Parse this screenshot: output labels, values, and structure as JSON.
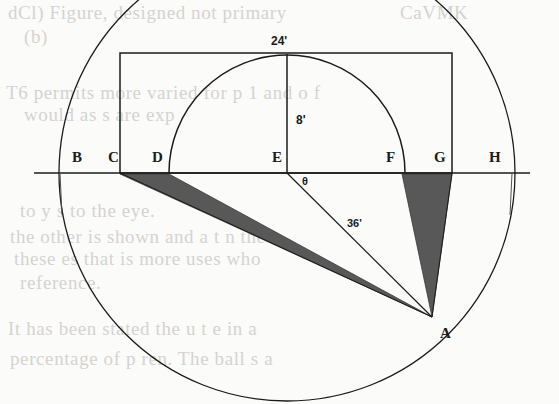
{
  "figure": {
    "background_color": "#fbfbfa",
    "stroke_color": "#1b1b1b",
    "shade_color": "#585858",
    "baseline": {
      "y": 173,
      "x_start": 34,
      "x_end": 530
    },
    "point_labels": [
      {
        "id": "B",
        "text": "B",
        "x": 72,
        "y": 150,
        "tick_x": 90
      },
      {
        "id": "C",
        "text": "C",
        "x": 108,
        "y": 150,
        "tick_x": 120
      },
      {
        "id": "D",
        "text": "D",
        "x": 152,
        "y": 150,
        "tick_x": 168
      },
      {
        "id": "E",
        "text": "E",
        "x": 272,
        "y": 150,
        "tick_x": 287
      },
      {
        "id": "F",
        "text": "F",
        "x": 386,
        "y": 150,
        "tick_x": 402
      },
      {
        "id": "G",
        "text": "G",
        "x": 434,
        "y": 150,
        "tick_x": 452
      },
      {
        "id": "H",
        "text": "H",
        "x": 489,
        "y": 150,
        "tick_x": 503
      },
      {
        "id": "A",
        "text": "A",
        "x": 440,
        "y": 326,
        "tick_x": 432
      }
    ],
    "dimensions": [
      {
        "id": "span-top",
        "text": "24'",
        "x": 271,
        "y": 35
      },
      {
        "id": "height-rise",
        "text": "8'",
        "x": 296,
        "y": 114
      },
      {
        "id": "angle-theta",
        "text": "θ",
        "x": 302,
        "y": 176
      },
      {
        "id": "radius-sight",
        "text": "36'",
        "x": 347,
        "y": 218
      }
    ],
    "rectangle": {
      "x": 120,
      "y": 53,
      "width": 332,
      "height": 120
    },
    "semicircle": {
      "cx": 287,
      "cy": 173,
      "r": 118
    },
    "large_circle": {
      "cx": 287,
      "cy": 173,
      "r": 228
    },
    "vertex_a": {
      "x": 432,
      "y": 317
    },
    "shaded_triangles": [
      {
        "id": "left-shaded-triangle",
        "p1": "C",
        "p2": "D",
        "apex": "A"
      },
      {
        "id": "right-shaded-triangle",
        "p1": "F",
        "p2": "G",
        "apex": "A"
      }
    ],
    "sight_lines": [
      {
        "id": "line-e-a",
        "from": "E",
        "to": "A"
      },
      {
        "id": "line-c-a",
        "from": "C",
        "to": "A"
      },
      {
        "id": "line-d-a",
        "from": "D",
        "to": "A"
      },
      {
        "id": "line-f-a",
        "from": "F",
        "to": "A"
      },
      {
        "id": "line-g-a",
        "from": "G",
        "to": "A"
      }
    ]
  },
  "ghost_text": [
    {
      "text": "dCl) Figure, designed not  primary",
      "x": 8,
      "y": 2
    },
    {
      "text": "(b)",
      "x": 24,
      "y": 26
    },
    {
      "text": "T6  permits  more varied  for  p 1 and o f",
      "x": 6,
      "y": 82
    },
    {
      "text": "would  as s are exp",
      "x": 24,
      "y": 104
    },
    {
      "text": "to y s to the eye.",
      "x": 20,
      "y": 200
    },
    {
      "text": "the  other  is  shown  and  a  t  n  the",
      "x": 10,
      "y": 226
    },
    {
      "text": "these  es that  is  more  uses  who",
      "x": 14,
      "y": 248
    },
    {
      "text": "reference.",
      "x": 20,
      "y": 272
    },
    {
      "text": "It  has  been  stated  the  u  t  e  in  a",
      "x": 8,
      "y": 318
    },
    {
      "text": "percentage  of  p  ren.  The ball  s a",
      "x": 10,
      "y": 348
    },
    {
      "text": "CaVMK",
      "x": 400,
      "y": 2
    }
  ]
}
